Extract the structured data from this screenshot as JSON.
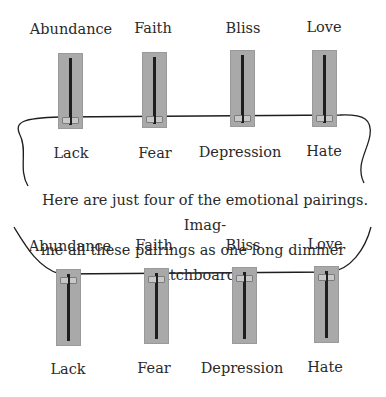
{
  "top_group": {
    "upper_labels": [
      "Abundance",
      "Faith",
      "Bliss",
      "Love"
    ],
    "lower_labels": [
      "Lack",
      "Fear",
      "Depression",
      "Hate"
    ],
    "slider_position": "bottom"
  },
  "caption": {
    "line1": "Here are just four of the emotional pairings. Imag-",
    "line2": "ine all these pairings as one long dimmer switchboard."
  },
  "bottom_group": {
    "upper_labels": [
      "Abundance",
      "Faith",
      "Bliss",
      "Love"
    ],
    "lower_labels": [
      "Lack",
      "Fear",
      "Depression",
      "Hate"
    ],
    "slider_position": "top"
  },
  "colors": {
    "slider_body": "#a9a9a9",
    "track": "#1e1e1e",
    "knob": "#c8c8c8",
    "line": "#1e1e1e",
    "text": "#2a2a2a"
  }
}
